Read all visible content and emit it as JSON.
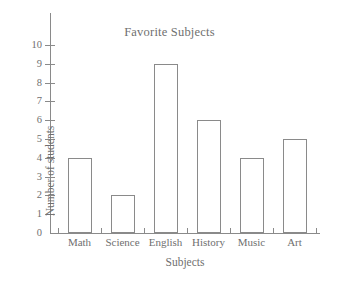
{
  "chart_data": {
    "type": "bar",
    "title": "Favorite Subjects",
    "xlabel": "Subjects",
    "ylabel": "Number of students",
    "categories": [
      "Math",
      "Science",
      "English",
      "History",
      "Music",
      "Art"
    ],
    "values": [
      4,
      2,
      9,
      6,
      4,
      5
    ],
    "ylim": [
      0,
      10
    ],
    "ytick_labels": [
      "0",
      "1",
      "2",
      "3",
      "4",
      "5",
      "6",
      "7",
      "8",
      "9",
      "10"
    ],
    "ytick_values": [
      0,
      1,
      2,
      3,
      4,
      5,
      6,
      7,
      8,
      9,
      10
    ],
    "grid": false,
    "legend": false,
    "legend_position": "none",
    "bar_fill": "#ffffff",
    "bar_stroke": "#8a8a8a",
    "axis_color": "#8a8a8a",
    "text_color": "#6f6f6f",
    "background": "#ffffff"
  }
}
